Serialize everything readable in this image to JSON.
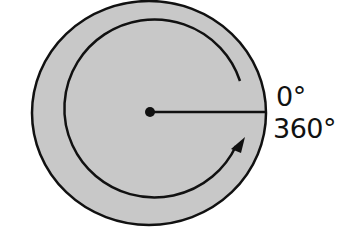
{
  "diagram": {
    "type": "angle-rotation",
    "labels": {
      "start_angle": "0°",
      "end_angle": "360°"
    },
    "colors": {
      "fill": "#c8c8c8",
      "stroke": "#111111",
      "background": "#ffffff"
    },
    "geometry": {
      "center": [
        150,
        112
      ],
      "outer_rx": 117,
      "outer_ry": 112,
      "arc_r": 90,
      "rotation_direction": "counterclockwise"
    }
  }
}
